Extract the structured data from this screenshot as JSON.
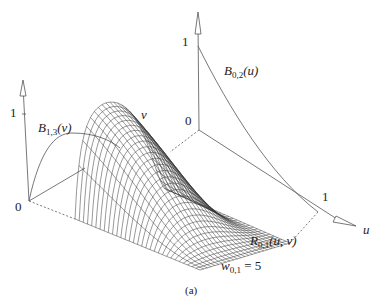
{
  "figure": {
    "caption": "(a)",
    "labels": {
      "left_axis_one": "1",
      "left_axis_zero": "0",
      "right_axis_one": "1",
      "right_axis_zero": "0",
      "u_axis_one": "1",
      "u_axis_name": "u",
      "v_axis_name": "v",
      "b13_main": "B",
      "b13_sub": "1,3",
      "b13_arg": "(v)",
      "b02_main": "B",
      "b02_sub": "0,2",
      "b02_arg": "(u)",
      "r01_main": "R",
      "r01_sub": "0,1",
      "r01_arg": "(u, v)",
      "w_main": "w",
      "w_sub": "0,1",
      "w_rest": " = 5"
    },
    "colors": {
      "line": "#555555",
      "mesh": "#333333",
      "text": "#222222"
    },
    "mesh": {
      "base_front_left": [
        75,
        219
      ],
      "base_front_right": [
        200,
        270
      ],
      "base_back_right": [
        290,
        243
      ],
      "base_back_left": [
        168,
        190
      ],
      "rows": 24,
      "cols": 30,
      "height_px": 95,
      "weight": 5
    }
  }
}
